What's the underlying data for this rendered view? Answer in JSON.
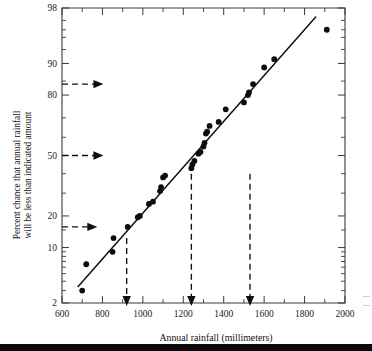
{
  "figure": {
    "background": "#ffffff",
    "ink_color": "#101010"
  },
  "chart_data": {
    "type": "scatter",
    "title": "",
    "subtitle": "",
    "xlabel": "Annual rainfall (millimeters)",
    "ylabel": "Percent chance that annual rainfall will be less than indicated amount",
    "ylabel_line1": "Percent chance that annual rainfall",
    "ylabel_line2": "will be less than indicated amount",
    "x_scale": "linear",
    "y_scale": "normal-probability",
    "xlim": [
      600,
      2000
    ],
    "ylim": [
      2,
      98
    ],
    "grid": false,
    "legend": null,
    "x_ticks": [
      600,
      800,
      1000,
      1200,
      1400,
      1600,
      1800,
      2000
    ],
    "x_tick_labels": [
      "600",
      "800",
      "1000",
      "1200",
      "1400",
      "1600",
      "1800",
      "2000"
    ],
    "x_minor_ticks": [
      700,
      900,
      1100,
      1300,
      1500,
      1700,
      1900
    ],
    "y_ticks": [
      2,
      5,
      10,
      20,
      30,
      40,
      50,
      60,
      70,
      80,
      90,
      95,
      98
    ],
    "y_tick_labels_shown": [
      "2",
      "10",
      "20",
      "50",
      "80",
      "90",
      "98"
    ],
    "y_labeled_ticks": [
      2,
      10,
      20,
      50,
      80,
      90,
      98
    ],
    "series": [
      {
        "name": "Annual rainfall observations",
        "marker": "filled-circle",
        "points": [
          {
            "x": 700,
            "y": 3
          },
          {
            "x": 720,
            "y": 6.5
          },
          {
            "x": 850,
            "y": 9
          },
          {
            "x": 855,
            "y": 12.5
          },
          {
            "x": 925,
            "y": 16
          },
          {
            "x": 975,
            "y": 19.5
          },
          {
            "x": 985,
            "y": 20
          },
          {
            "x": 1030,
            "y": 25
          },
          {
            "x": 1050,
            "y": 26
          },
          {
            "x": 1085,
            "y": 31
          },
          {
            "x": 1090,
            "y": 33
          },
          {
            "x": 1100,
            "y": 38
          },
          {
            "x": 1110,
            "y": 39
          },
          {
            "x": 1240,
            "y": 43
          },
          {
            "x": 1245,
            "y": 45
          },
          {
            "x": 1255,
            "y": 47
          },
          {
            "x": 1275,
            "y": 51
          },
          {
            "x": 1285,
            "y": 52
          },
          {
            "x": 1300,
            "y": 55
          },
          {
            "x": 1305,
            "y": 57
          },
          {
            "x": 1312,
            "y": 62
          },
          {
            "x": 1318,
            "y": 63
          },
          {
            "x": 1330,
            "y": 66
          },
          {
            "x": 1375,
            "y": 68
          },
          {
            "x": 1410,
            "y": 74
          },
          {
            "x": 1500,
            "y": 77
          },
          {
            "x": 1520,
            "y": 80
          },
          {
            "x": 1525,
            "y": 81
          },
          {
            "x": 1545,
            "y": 84
          },
          {
            "x": 1600,
            "y": 89
          },
          {
            "x": 1650,
            "y": 91
          },
          {
            "x": 1910,
            "y": 96
          }
        ]
      }
    ],
    "fit_line": {
      "name": "fitted straight line",
      "start": {
        "x": 680,
        "y": 3.4
      },
      "end": {
        "x": 1855,
        "y": 97.3
      }
    },
    "annotations": [
      {
        "id": "h-arrow-84",
        "type": "horizontal-dashed-arrow",
        "y": 84,
        "x_start": 600,
        "x_end": 790,
        "direction": "right"
      },
      {
        "id": "h-arrow-50",
        "type": "horizontal-dashed-arrow",
        "y": 50,
        "x_start": 600,
        "x_end": 790,
        "direction": "right"
      },
      {
        "id": "h-arrow-16",
        "type": "horizontal-dashed-arrow",
        "y": 16,
        "x_start": 600,
        "x_end": 760,
        "direction": "right"
      },
      {
        "id": "v-arrow-920",
        "type": "vertical-dashed-arrow",
        "x": 920,
        "y_start": 12.5,
        "y_end": 2,
        "direction": "down"
      },
      {
        "id": "v-arrow-1240",
        "type": "vertical-dashed-arrow",
        "x": 1240,
        "y_start": 40,
        "y_end": 2,
        "direction": "down"
      },
      {
        "id": "v-arrow-1530",
        "type": "vertical-dashed-arrow",
        "x": 1530,
        "y_start": 40,
        "y_end": 2,
        "direction": "down"
      }
    ]
  }
}
